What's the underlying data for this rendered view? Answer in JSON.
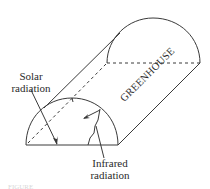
{
  "diagram": {
    "labels": {
      "solar": "Solar radiation",
      "solar_line1": "Solar",
      "solar_line2": "radiation",
      "infrared_line1": "Infrared",
      "infrared_line2": "radiation",
      "greenhouse": "GREENHOUSE"
    },
    "caption_fragment": "FIGURE",
    "colors": {
      "stroke": "#3a3a3a",
      "text": "#2a2a2a",
      "background": "#ffffff"
    },
    "shapes": {
      "front_semicircle": {
        "left_x": 26,
        "right_x": 118,
        "base_y": 145,
        "top_y": 98
      },
      "back_semicircle": {
        "left_x": 107,
        "right_x": 200,
        "base_y": 63,
        "top_y": 18
      }
    }
  }
}
